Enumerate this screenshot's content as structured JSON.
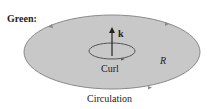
{
  "title": "Green:",
  "labels": {
    "k": "k",
    "curl": "Curl",
    "region": "R",
    "circulation": "Circulation"
  },
  "colors": {
    "region_fill": "#c8c8c8",
    "outline": "#8a8a8a",
    "text": "#222222"
  }
}
